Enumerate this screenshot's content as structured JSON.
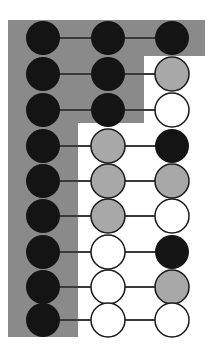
{
  "figure": {
    "width": 213,
    "height": 357,
    "background_color": "#ffffff"
  },
  "palette": {
    "panel_gray": "#8a8a8a",
    "node_black": "#141414",
    "node_gray": "#a8a8a8",
    "node_white": "#ffffff",
    "node_outline": "#1a1a1a",
    "connector": "#3a3a3a"
  },
  "geometry": {
    "columns_x": [
      43,
      108,
      172
    ],
    "rows_y": [
      38,
      74,
      110,
      146,
      181,
      216,
      252,
      287,
      320
    ],
    "node_radius": 17,
    "connector_width": 2,
    "outline_width": 1.5
  },
  "panel": {
    "name": "gray-staircase-region",
    "fill": "#8a8a8a",
    "description": "Staircase shaped gray region covering the left column for all rows, the middle column for the first three rows, and the right column for the first row only.",
    "points": "8,20 205,20 205,56 144,56 144,123 78,123 78,337 8,337"
  },
  "columns": [
    {
      "index": 0,
      "name": "left-column",
      "x": 43
    },
    {
      "index": 1,
      "name": "middle-column",
      "x": 108
    },
    {
      "index": 2,
      "name": "right-column",
      "x": 172
    }
  ],
  "rows": [
    {
      "index": 0,
      "y": 38,
      "nodes": [
        {
          "column": 0,
          "fill": "black",
          "in_panel": true
        },
        {
          "column": 1,
          "fill": "black",
          "in_panel": true
        },
        {
          "column": 2,
          "fill": "black",
          "in_panel": true
        }
      ]
    },
    {
      "index": 1,
      "y": 74,
      "nodes": [
        {
          "column": 0,
          "fill": "black",
          "in_panel": true
        },
        {
          "column": 1,
          "fill": "black",
          "in_panel": true
        },
        {
          "column": 2,
          "fill": "gray",
          "in_panel": false
        }
      ]
    },
    {
      "index": 2,
      "y": 110,
      "nodes": [
        {
          "column": 0,
          "fill": "black",
          "in_panel": true
        },
        {
          "column": 1,
          "fill": "black",
          "in_panel": true
        },
        {
          "column": 2,
          "fill": "white",
          "in_panel": false
        }
      ]
    },
    {
      "index": 3,
      "y": 146,
      "nodes": [
        {
          "column": 0,
          "fill": "black",
          "in_panel": true
        },
        {
          "column": 1,
          "fill": "gray",
          "in_panel": false
        },
        {
          "column": 2,
          "fill": "black",
          "in_panel": false
        }
      ]
    },
    {
      "index": 4,
      "y": 181,
      "nodes": [
        {
          "column": 0,
          "fill": "black",
          "in_panel": true
        },
        {
          "column": 1,
          "fill": "gray",
          "in_panel": false
        },
        {
          "column": 2,
          "fill": "gray",
          "in_panel": false
        }
      ]
    },
    {
      "index": 5,
      "y": 216,
      "nodes": [
        {
          "column": 0,
          "fill": "black",
          "in_panel": true
        },
        {
          "column": 1,
          "fill": "gray",
          "in_panel": false
        },
        {
          "column": 2,
          "fill": "white",
          "in_panel": false
        }
      ]
    },
    {
      "index": 6,
      "y": 252,
      "nodes": [
        {
          "column": 0,
          "fill": "black",
          "in_panel": true
        },
        {
          "column": 1,
          "fill": "white",
          "in_panel": false
        },
        {
          "column": 2,
          "fill": "black",
          "in_panel": false
        }
      ]
    },
    {
      "index": 7,
      "y": 287,
      "nodes": [
        {
          "column": 0,
          "fill": "black",
          "in_panel": true
        },
        {
          "column": 1,
          "fill": "white",
          "in_panel": false
        },
        {
          "column": 2,
          "fill": "gray",
          "in_panel": false
        }
      ]
    },
    {
      "index": 8,
      "y": 320,
      "nodes": [
        {
          "column": 0,
          "fill": "black",
          "in_panel": true
        },
        {
          "column": 1,
          "fill": "white",
          "in_panel": false
        },
        {
          "column": 2,
          "fill": "white",
          "in_panel": false
        }
      ]
    }
  ]
}
